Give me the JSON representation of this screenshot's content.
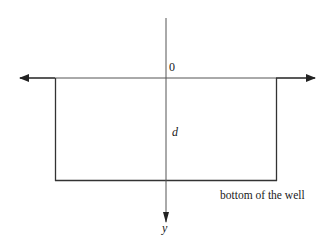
{
  "diagram": {
    "type": "infinite square well",
    "labels": {
      "origin": "0",
      "depth": "d",
      "axis": "y",
      "bottom": "bottom of the well"
    },
    "colors": {
      "line": "#333333",
      "text": "#1a1a1a",
      "background": "#ffffff"
    }
  }
}
